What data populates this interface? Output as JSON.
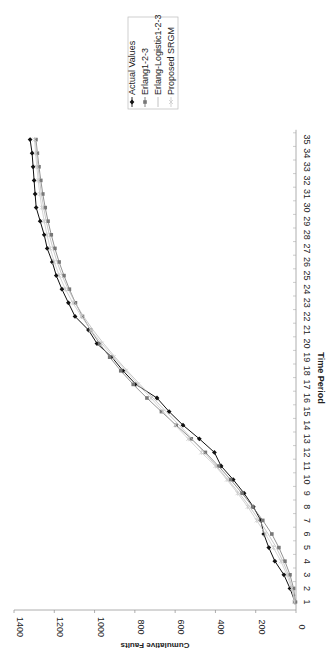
{
  "chart_data": {
    "type": "line",
    "orientation": "rotated-90-clockwise",
    "title": "",
    "xlabel": "Time Period",
    "ylabel": "Cumulative Faults",
    "ylim": [
      0,
      1400
    ],
    "yticks": [
      0,
      200,
      400,
      600,
      800,
      1000,
      1200,
      1400
    ],
    "categories": [
      "1",
      "2",
      "3",
      "4",
      "5",
      "6",
      "7",
      "8",
      "9",
      "10",
      "11",
      "12",
      "13",
      "14",
      "15",
      "16",
      "17",
      "18",
      "19",
      "20",
      "21",
      "22",
      "23",
      "24",
      "25",
      "26",
      "27",
      "28",
      "29",
      "30",
      "31",
      "32",
      "33",
      "34",
      "35"
    ],
    "grid": false,
    "legend_position": "right",
    "series": [
      {
        "name": "Actual Values",
        "color": "#111111",
        "marker": "diamond",
        "values": [
          5,
          30,
          60,
          105,
          135,
          160,
          175,
          212,
          258,
          312,
          372,
          405,
          480,
          561,
          630,
          690,
          795,
          859,
          914,
          988,
          1030,
          1097,
          1130,
          1162,
          1190,
          1210,
          1235,
          1250,
          1270,
          1290,
          1295,
          1300,
          1305,
          1310,
          1320
        ]
      },
      {
        "name": "Erlang1-2-3",
        "color": "#777777",
        "marker": "square",
        "values": [
          3,
          12,
          30,
          55,
          85,
          120,
          165,
          215,
          268,
          325,
          385,
          450,
          520,
          595,
          668,
          740,
          808,
          870,
          925,
          975,
          1020,
          1060,
          1095,
          1125,
          1152,
          1176,
          1197,
          1215,
          1231,
          1245,
          1257,
          1267,
          1276,
          1284,
          1291
        ]
      },
      {
        "name": "Erlang-Logistic1-2-3",
        "color": "#bbbbbb",
        "marker": "none",
        "values": [
          6,
          18,
          38,
          65,
          98,
          138,
          182,
          230,
          282,
          338,
          395,
          455,
          517,
          580,
          645,
          710,
          775,
          838,
          898,
          955,
          1008,
          1055,
          1096,
          1131,
          1161,
          1186,
          1207,
          1225,
          1240,
          1253,
          1264,
          1273,
          1281,
          1288,
          1294
        ]
      },
      {
        "name": "Proposed SRGM",
        "color": "#cccccc",
        "marker": "asterisk",
        "values": [
          8,
          22,
          45,
          75,
          112,
          152,
          195,
          240,
          290,
          343,
          400,
          470,
          535,
          600,
          660,
          720,
          785,
          845,
          905,
          965,
          1018,
          1065,
          1108,
          1145,
          1175,
          1200,
          1220,
          1236,
          1250,
          1262,
          1272,
          1280,
          1287,
          1293,
          1298
        ]
      }
    ]
  },
  "legend": {
    "items": [
      {
        "label": "Actual Values"
      },
      {
        "label": "Erlang1-2-3"
      },
      {
        "label": "Erlang-Logistic1-2-3"
      },
      {
        "label": "Proposed SRGM"
      }
    ]
  },
  "axes": {
    "x_title": "Time Period",
    "y_title": "Cumulative Faults"
  }
}
